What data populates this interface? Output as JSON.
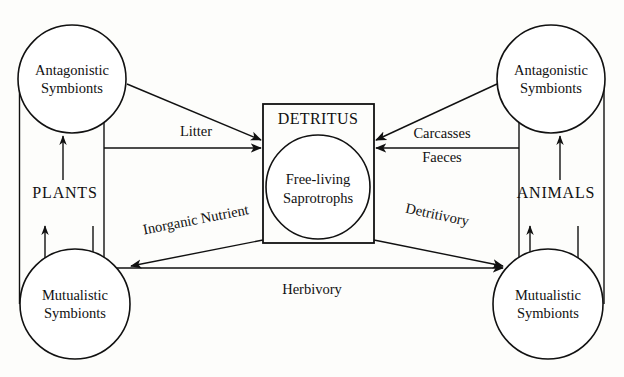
{
  "diagram": {
    "type": "ecosystem-flow-diagram",
    "background_color": "#fdfdfb",
    "stroke_color": "#111111",
    "nodes": {
      "plants_group": {
        "label": "PLANTS"
      },
      "animals_group": {
        "label": "ANIMALS"
      },
      "plant_antagonistic": {
        "line1": "Antagonistic",
        "line2": "Symbionts"
      },
      "plant_mutualistic": {
        "line1": "Mutualistic",
        "line2": "Symbionts"
      },
      "animal_antagonistic": {
        "line1": "Antagonistic",
        "line2": "Symbionts"
      },
      "animal_mutualistic": {
        "line1": "Mutualistic",
        "line2": "Symbionts"
      },
      "detritus_box": {
        "title": "DETRITUS"
      },
      "saprotrophs": {
        "line1": "Free-living",
        "line2": "Saprotrophs"
      }
    },
    "edges": {
      "litter": {
        "label": "Litter"
      },
      "carcasses": {
        "label": "Carcasses"
      },
      "faeces": {
        "label": "Faeces"
      },
      "inorganic_nutrient": {
        "label": "Inorganic Nutrient"
      },
      "detritivory": {
        "label": "Detritivory"
      },
      "herbivory": {
        "label": "Herbivory"
      }
    }
  }
}
